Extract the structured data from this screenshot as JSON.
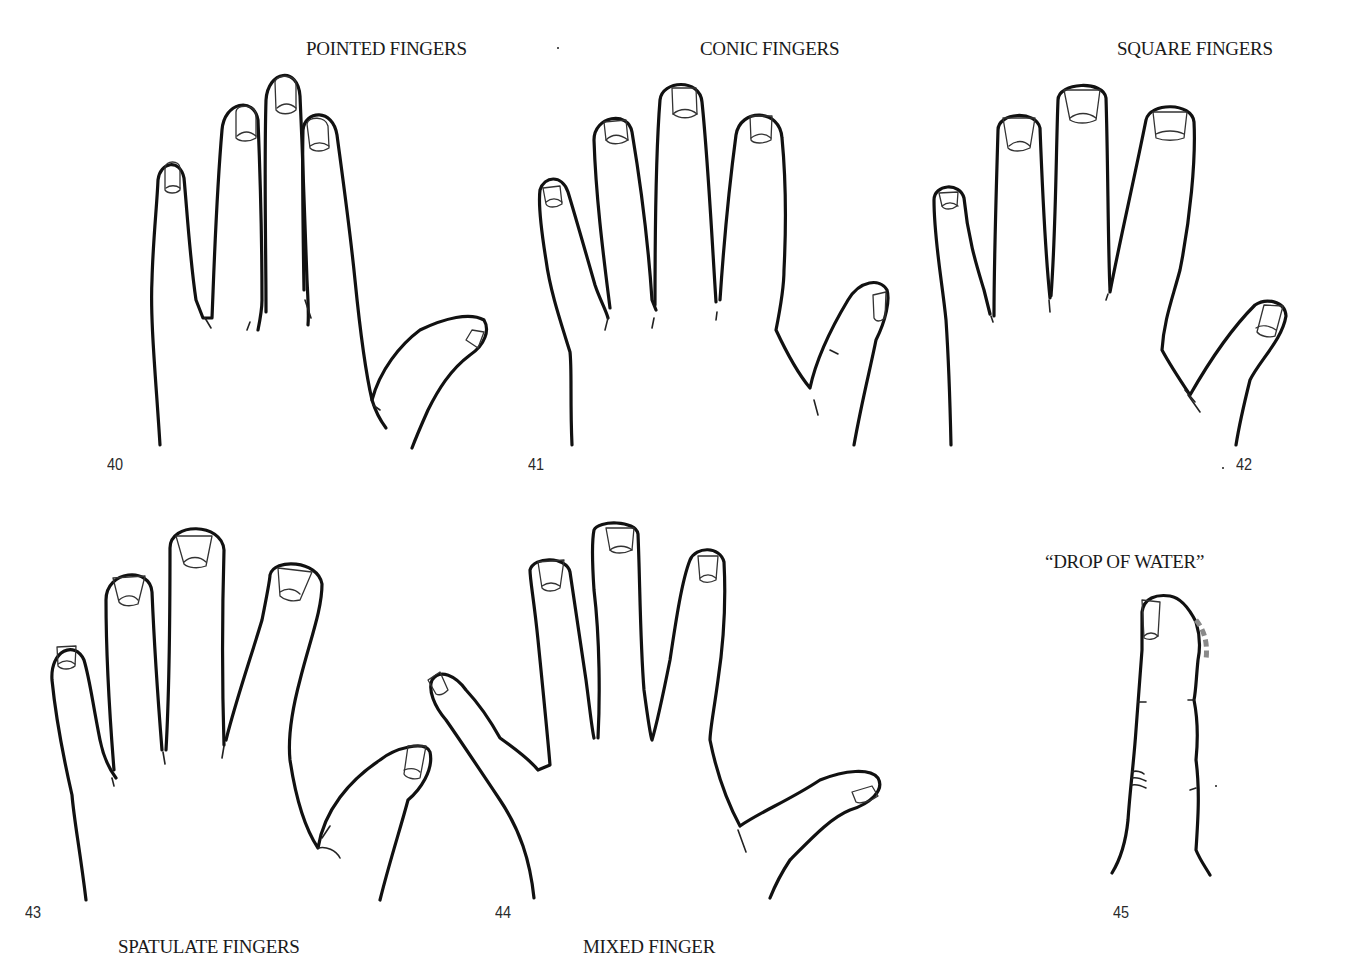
{
  "figures": [
    {
      "number": "40",
      "title": "POINTED FINGERS"
    },
    {
      "number": "41",
      "title": "CONIC FINGERS"
    },
    {
      "number": "42",
      "title": "SQUARE FINGERS"
    },
    {
      "number": "43",
      "title": "SPATULATE FINGERS"
    },
    {
      "number": "44",
      "title": "MIXED FINGER"
    },
    {
      "number": "45",
      "title": "“DROP OF WATER”"
    }
  ],
  "colors": {
    "line": "#111111",
    "drop_mark": "#8a8a8a",
    "background": "#ffffff"
  }
}
